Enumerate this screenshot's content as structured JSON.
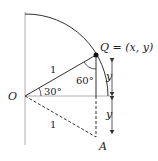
{
  "diagram": {
    "labels": {
      "origin": "O",
      "point_q": "Q = (x, y)",
      "point_a": "A",
      "radius_upper": "1",
      "radius_lower": "1",
      "angle_30": "30°",
      "angle_60": "60°",
      "y_upper": "y",
      "y_lower": "y"
    },
    "colors": {
      "stroke": "#333333",
      "axis": "#999999",
      "background": "#ffffff"
    }
  }
}
